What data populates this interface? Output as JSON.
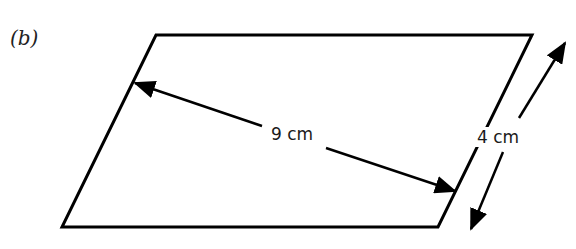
{
  "diagram": {
    "part_label": "(b)",
    "shape": "parallelogram",
    "vertices": [
      [
        156,
        35
      ],
      [
        532,
        35
      ],
      [
        438,
        227
      ],
      [
        62,
        227
      ]
    ],
    "dimensions": {
      "diagonal_like": {
        "label": "9 cm",
        "from": [
          132,
          82
        ],
        "to": [
          457,
          192
        ]
      },
      "height_side": {
        "label": "4 cm",
        "from": [
          566,
          42
        ],
        "to": [
          470,
          230
        ]
      }
    },
    "colors": {
      "line": "#000000",
      "background": "#ffffff"
    }
  }
}
